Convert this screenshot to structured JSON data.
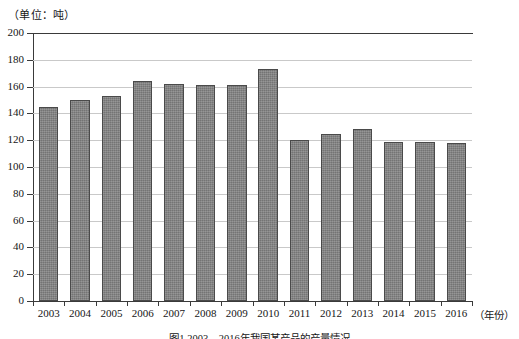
{
  "unit_label": "（单位：吨）",
  "axis": {
    "x_unit_label": "（年份）",
    "y_ticks": [
      "0",
      "20",
      "40",
      "60",
      "80",
      "100",
      "120",
      "140",
      "160",
      "180",
      "200"
    ]
  },
  "caption": "图1 2003—2016年我国某产品的产量情况",
  "colors": {
    "bar_fill": "#7e7e7e",
    "bar_border": "#4a4a4a",
    "gridline": "#c9c9c9",
    "axis": "#3a3a3a",
    "text": "#161616",
    "background": "#ffffff"
  },
  "chart_data": {
    "type": "bar",
    "title": "",
    "subtitle": "",
    "xlabel": "（年份）",
    "ylabel": "（单位：吨）",
    "ylim": [
      0,
      200
    ],
    "ytick_step": 20,
    "grid": true,
    "legend": "none",
    "categories": [
      "2003",
      "2004",
      "2005",
      "2006",
      "2007",
      "2008",
      "2009",
      "2010",
      "2011",
      "2012",
      "2013",
      "2014",
      "2015",
      "2016"
    ],
    "values": [
      145,
      150,
      153,
      164,
      162,
      161,
      161,
      173,
      120,
      125,
      128,
      119,
      119,
      118
    ],
    "series": [
      {
        "name": "产量",
        "values": [
          145,
          150,
          153,
          164,
          162,
          161,
          161,
          173,
          120,
          125,
          128,
          119,
          119,
          118
        ]
      }
    ]
  }
}
